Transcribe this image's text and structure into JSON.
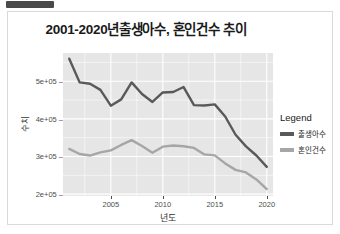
{
  "window": {
    "chrome_bar": "title-bar-fragment"
  },
  "chart_data": {
    "type": "line",
    "title": "2001-2020년출생아수, 혼인건수 추이",
    "xlabel": "년도",
    "ylabel": "수치",
    "x": [
      2001,
      2002,
      2003,
      2004,
      2005,
      2006,
      2007,
      2008,
      2009,
      2010,
      2011,
      2012,
      2013,
      2014,
      2015,
      2016,
      2017,
      2018,
      2019,
      2020
    ],
    "series": [
      {
        "name": "출생아수",
        "color": "#595959",
        "values": [
          559934,
          496911,
          493189,
          476958,
          435031,
          451759,
          496822,
          465892,
          444849,
          470171,
          471265,
          484550,
          436455,
          435435,
          438420,
          406243,
          357771,
          326822,
          302676,
          272337
        ]
      },
      {
        "name": "혼인건수",
        "color": "#a6a6a6",
        "values": [
          320063,
          306573,
          302503,
          310944,
          316375,
          330634,
          343559,
          327715,
          309759,
          326104,
          329087,
          327073,
          322807,
          305507,
          302828,
          281635,
          264455,
          257622,
          239159,
          213502
        ]
      }
    ],
    "ylim": [
      195000,
      575000
    ],
    "xlim": [
      2000.4,
      2020.6
    ],
    "yticks": [
      200000,
      300000,
      400000,
      500000
    ],
    "ytick_labels": [
      "2e+05",
      "3e+05",
      "4e+05",
      "5e+05"
    ],
    "xticks": [
      2005,
      2010,
      2015,
      2020
    ],
    "xtick_labels": [
      "2005",
      "2010",
      "2015",
      "2020"
    ],
    "grid": true,
    "panel_background": "#e6e6e6",
    "grid_color": "#ffffff",
    "legend_position": "right",
    "legend_title": "Legend"
  }
}
